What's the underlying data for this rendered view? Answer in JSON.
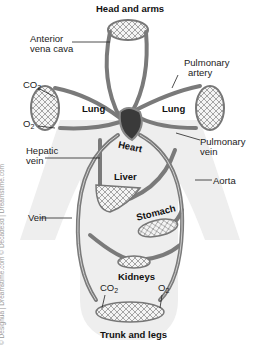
{
  "diagram": {
    "labels": {
      "head_and_arms": "Head and arms",
      "anterior_vena_cava": "Anterior\nvena cava",
      "anterior_vena_cava_line1": "Anterior",
      "anterior_vena_cava_line2": "vena cava",
      "pulmonary_artery_line1": "Pulmonary",
      "pulmonary_artery_line2": "artery",
      "co2_left": "CO",
      "co2_sub": "2",
      "o2_left": "O",
      "o2_sub": "2",
      "lung_left": "Lung",
      "lung_right": "Lung",
      "heart": "Heart",
      "hepatic_vein_line1": "Hepatic",
      "hepatic_vein_line2": "vein",
      "pulmonary_vein_line1": "Pulmonary",
      "pulmonary_vein_line2": "vein",
      "liver": "Liver",
      "aorta": "Aorta",
      "stomach": "Stomach",
      "vein": "Vein",
      "kidneys": "Kidneys",
      "co2_bottom": "CO",
      "o2_bottom": "O",
      "trunk_and_legs": "Trunk and legs"
    },
    "watermark": "© Designua | Dreamstime.com   © Decade3d | Dreamstime.com",
    "colors": {
      "vessel": "#7a7a7a",
      "vessel_highlight": "#cfcfcf",
      "organ_fill": "#f2f2f2",
      "body_silhouette": "#ececec",
      "heart": "#3a3a3a"
    }
  }
}
